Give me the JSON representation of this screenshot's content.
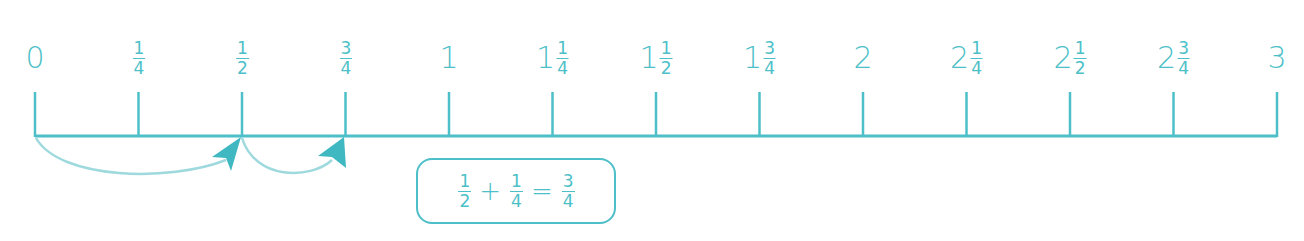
{
  "colors": {
    "primary": "#4dbfc8",
    "arrow": "#9ed9de",
    "arrowhead": "#3fb8c2"
  },
  "number_line": {
    "start": 0,
    "end": 3,
    "step": "1/4",
    "labels": [
      {
        "whole": "0",
        "num": "",
        "den": ""
      },
      {
        "whole": "",
        "num": "1",
        "den": "4"
      },
      {
        "whole": "",
        "num": "1",
        "den": "2"
      },
      {
        "whole": "",
        "num": "3",
        "den": "4"
      },
      {
        "whole": "1",
        "num": "",
        "den": ""
      },
      {
        "whole": "1",
        "num": "1",
        "den": "4"
      },
      {
        "whole": "1",
        "num": "1",
        "den": "2"
      },
      {
        "whole": "1",
        "num": "3",
        "den": "4"
      },
      {
        "whole": "2",
        "num": "",
        "den": ""
      },
      {
        "whole": "2",
        "num": "1",
        "den": "4"
      },
      {
        "whole": "2",
        "num": "1",
        "den": "2"
      },
      {
        "whole": "2",
        "num": "3",
        "den": "4"
      },
      {
        "whole": "3",
        "num": "",
        "den": ""
      }
    ],
    "jumps": [
      {
        "from": "0",
        "to": "1/2"
      },
      {
        "from": "1/2",
        "to": "3/4"
      }
    ]
  },
  "equation": {
    "a": {
      "num": "1",
      "den": "2"
    },
    "plus": "+",
    "b": {
      "num": "1",
      "den": "4"
    },
    "equals": "=",
    "result": {
      "num": "3",
      "den": "4"
    }
  }
}
